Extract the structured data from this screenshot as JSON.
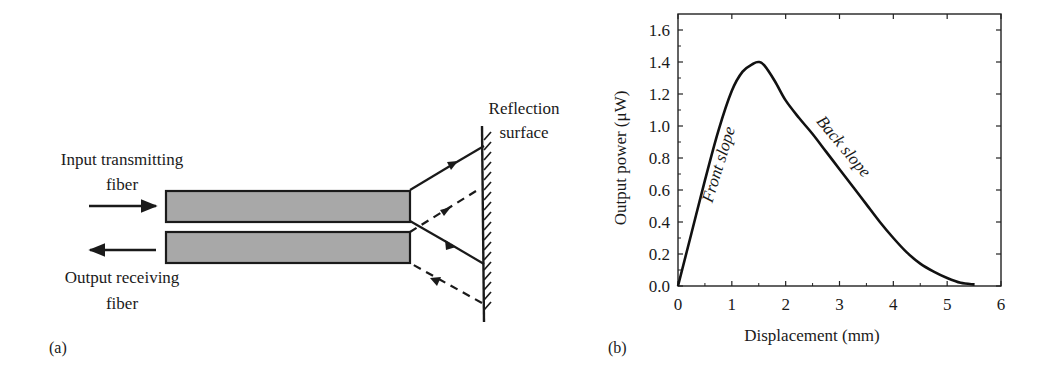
{
  "panel_a": {
    "label": "(a)",
    "input_fiber_label": [
      "Input transmitting",
      "fiber"
    ],
    "output_fiber_label": [
      "Output receiving",
      "fiber"
    ],
    "reflection_label": [
      "Reflection",
      "surface"
    ],
    "fiber_fill": "#a8a8a8",
    "line_color": "#1a1a1a"
  },
  "panel_b": {
    "label": "(b)",
    "xlabel": "Displacement (mm)",
    "ylabel": "Output power (μW)",
    "annotations": [
      "Front slope",
      "Back slope"
    ]
  },
  "chart_data": {
    "type": "line",
    "title": "",
    "xlabel": "Displacement (mm)",
    "ylabel": "Output power (μW)",
    "xlim": [
      0,
      6
    ],
    "ylim": [
      0,
      1.7
    ],
    "xticks": [
      0,
      1,
      2,
      3,
      4,
      5,
      6
    ],
    "yticks": [
      0.0,
      0.2,
      0.4,
      0.6,
      0.8,
      1.0,
      1.2,
      1.4,
      1.6
    ],
    "xtick_labels": [
      "0",
      "1",
      "2",
      "3",
      "4",
      "5",
      "6"
    ],
    "ytick_labels": [
      "0.0",
      "0.2",
      "0.4",
      "0.6",
      "0.8",
      "1.0",
      "1.2",
      "1.4",
      "1.6"
    ],
    "grid": false,
    "legend": null,
    "annotations": [
      {
        "text": "Front slope",
        "x": 0.85,
        "y": 0.75,
        "rotation": -73
      },
      {
        "text": "Back slope",
        "x": 3.0,
        "y": 0.85,
        "rotation": 50
      }
    ],
    "series": [
      {
        "name": "Output power",
        "x": [
          0.0,
          0.25,
          0.5,
          0.75,
          1.0,
          1.2,
          1.4,
          1.5,
          1.6,
          1.8,
          2.0,
          2.25,
          2.5,
          2.75,
          3.0,
          3.25,
          3.5,
          3.75,
          4.0,
          4.25,
          4.5,
          4.75,
          5.0,
          5.25,
          5.5
        ],
        "y": [
          0.0,
          0.33,
          0.66,
          0.97,
          1.22,
          1.34,
          1.39,
          1.4,
          1.38,
          1.28,
          1.16,
          1.05,
          0.95,
          0.84,
          0.73,
          0.62,
          0.51,
          0.4,
          0.3,
          0.21,
          0.14,
          0.09,
          0.05,
          0.02,
          0.01
        ]
      }
    ]
  }
}
